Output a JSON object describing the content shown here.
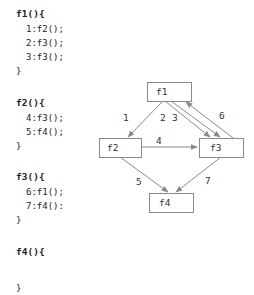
{
  "code": {
    "blocks": [
      {
        "header": "f1(){",
        "lines": [
          "1:f2();",
          "2:f3();",
          "3:f3();"
        ],
        "close": "}"
      },
      {
        "header": "f2(){",
        "lines": [
          "4:f3();",
          "5:f4();"
        ],
        "close": "}"
      },
      {
        "header": "f3(){",
        "lines": [
          "6:f1();",
          "7:f4():"
        ],
        "close": "}"
      },
      {
        "header": "f4(){",
        "lines": [],
        "close": "}"
      }
    ]
  },
  "diagram": {
    "nodes": [
      {
        "id": "f1",
        "label": "f1"
      },
      {
        "id": "f2",
        "label": "f2"
      },
      {
        "id": "f3",
        "label": "f3"
      },
      {
        "id": "f4",
        "label": "f4"
      }
    ],
    "edges": [
      {
        "label": "1",
        "from": "f1",
        "to": "f2"
      },
      {
        "label": "2",
        "from": "f1",
        "to": "f3"
      },
      {
        "label": "3",
        "from": "f1",
        "to": "f3"
      },
      {
        "label": "4",
        "from": "f2",
        "to": "f3"
      },
      {
        "label": "5",
        "from": "f2",
        "to": "f4"
      },
      {
        "label": "6",
        "from": "f3",
        "to": "f1"
      },
      {
        "label": "7",
        "from": "f3",
        "to": "f4"
      }
    ]
  }
}
